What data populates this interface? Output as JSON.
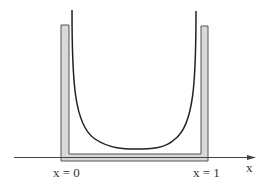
{
  "diagram": {
    "labels": {
      "left_wall": "x = 0",
      "right_wall": "x = 1",
      "axis": "x"
    },
    "colors": {
      "wall_fill": "#d8d8d8",
      "wall_stroke": "#555555",
      "curve": "#222222",
      "axis": "#444444"
    }
  }
}
